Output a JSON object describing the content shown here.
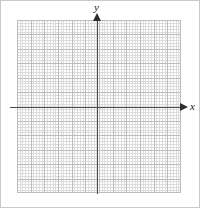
{
  "figure": {
    "type": "blank-cartesian-grid",
    "width": 200,
    "height": 208,
    "background_color": "#ffffff",
    "border_color": "#c9c9c9"
  },
  "axes": {
    "x": {
      "label": "x",
      "label_style": "italic",
      "color": "#4a4a4a",
      "arrow_direction": "right",
      "arrow_color": "#2e2e2e"
    },
    "y": {
      "label": "y",
      "label_style": "italic",
      "color": "#4a4a4a",
      "arrow_direction": "up",
      "arrow_color": "#2e2e2e"
    },
    "origin": {
      "x": 98,
      "y": 108
    }
  },
  "grid": {
    "major_color": "#bcbcbc",
    "minor_color": "#d6d6d6",
    "major_columns": 12,
    "major_rows": 12,
    "minor_per_major": 5,
    "columns_left_of_y_axis": 6,
    "columns_right_of_y_axis": 6,
    "rows_above_x_axis": 6,
    "rows_below_x_axis": 6,
    "bounds": {
      "left": 17,
      "top": 20,
      "width": 164,
      "height": 173
    }
  },
  "chart_data": {
    "type": "scatter",
    "title": "",
    "subtitle": "",
    "xlabel": "x",
    "ylabel": "y",
    "xlim": [
      -6,
      6
    ],
    "ylim": [
      -6,
      6
    ],
    "xticks": [
      -6,
      -5,
      -4,
      -3,
      -2,
      -1,
      0,
      1,
      2,
      3,
      4,
      5,
      6
    ],
    "yticks": [
      -6,
      -5,
      -4,
      -3,
      -2,
      -1,
      0,
      1,
      2,
      3,
      4,
      5,
      6
    ],
    "xticklabels": [
      "",
      "",
      "",
      "",
      "",
      "",
      "",
      "",
      "",
      "",
      "",
      "",
      ""
    ],
    "yticklabels": [
      "",
      "",
      "",
      "",
      "",
      "",
      "",
      "",
      "",
      "",
      "",
      "",
      ""
    ],
    "grid": true,
    "minor_grid": true,
    "legend": null,
    "legend_position": "none",
    "annotations": [],
    "series": [],
    "x": [],
    "values": [],
    "note": "Empty coordinate plane: gridded blank graph paper with labeled x and y axes and no plotted data."
  }
}
